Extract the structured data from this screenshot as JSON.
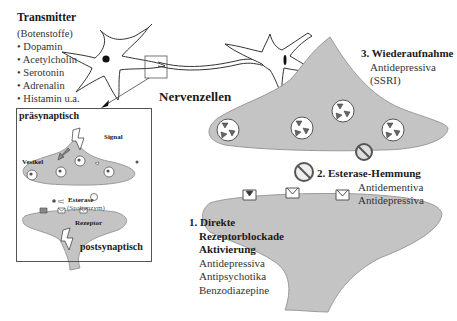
{
  "transmitter": {
    "title": "Transmitter",
    "subtitle": "(Botenstoffe)",
    "items": [
      "• Dopamin",
      "• Acetylcholin",
      "• Serotonin",
      "• Adrenalin",
      "• Histamin u.a."
    ]
  },
  "neurons": {
    "label": "Nervenzellen"
  },
  "inset": {
    "pre_label": "präsynaptisch",
    "post_label": "postsynaptisch",
    "signal": "Signal",
    "vesikel": "Vesikel",
    "esterase": "Esterase",
    "esterase_sub": "(Spaltenzym)",
    "rezeptor": "Rezeptor"
  },
  "mechanisms": {
    "m1": {
      "title_lines": [
        "1. Direkte",
        "Rezeptorblockade",
        "Aktivierung"
      ],
      "drugs": [
        "Antidepressiva",
        "Antipsychotika",
        "Benzodiazepine"
      ]
    },
    "m2": {
      "title": "2. Esterase-Hemmung",
      "drugs": [
        "Antidementiva",
        "Antidepressiva"
      ]
    },
    "m3": {
      "title": "3. Wiederaufnahme",
      "drugs": [
        "Antidepressiva",
        "(SSRI)"
      ]
    }
  },
  "colors": {
    "membrane_fill": "#c4c4c4",
    "membrane_stroke": "#9a9a9a",
    "outline": "#333333",
    "text": "#1a1a1a"
  }
}
